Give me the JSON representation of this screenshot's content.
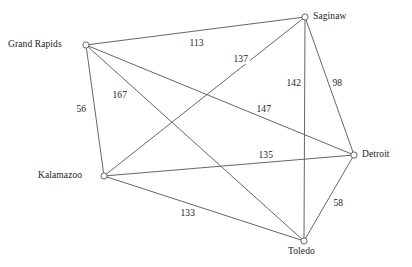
{
  "diagram": {
    "type": "weighted-undirected-graph",
    "background_color": "#ffffff",
    "line_color": "#555555",
    "text_color": "#1a1a1a",
    "width": 412,
    "height": 267,
    "nodes": [
      {
        "id": "grand-rapids",
        "label": "Grand Rapids",
        "x": 86,
        "y": 45,
        "label_x": 8,
        "label_y": 39,
        "label_anchor": "left"
      },
      {
        "id": "saginaw",
        "label": "Saginaw",
        "x": 305,
        "y": 17,
        "label_x": 313,
        "label_y": 11,
        "label_anchor": "left"
      },
      {
        "id": "detroit",
        "label": "Detroit",
        "x": 354,
        "y": 155,
        "label_x": 362,
        "label_y": 149,
        "label_anchor": "left"
      },
      {
        "id": "kalamazoo",
        "label": "Kalamazoo",
        "x": 104,
        "y": 176,
        "label_x": 38,
        "label_y": 170,
        "label_anchor": "left"
      },
      {
        "id": "toledo",
        "label": "Toledo",
        "x": 304,
        "y": 241,
        "label_x": 288,
        "label_y": 246,
        "label_anchor": "left"
      }
    ],
    "edges": [
      {
        "id": "gr-sag",
        "from": "grand-rapids",
        "to": "saginaw",
        "weight": "113",
        "label_x": 188,
        "label_y": 38
      },
      {
        "id": "kal-sag",
        "from": "kalamazoo",
        "to": "saginaw",
        "weight": "137",
        "label_x": 232,
        "label_y": 54
      },
      {
        "id": "sag-tol",
        "from": "saginaw",
        "to": "toledo",
        "weight": "142",
        "label_x": 285,
        "label_y": 78
      },
      {
        "id": "sag-det",
        "from": "saginaw",
        "to": "detroit",
        "weight": "98",
        "label_x": 331,
        "label_y": 78
      },
      {
        "id": "gr-kal",
        "from": "grand-rapids",
        "to": "kalamazoo",
        "weight": "56",
        "label_x": 75,
        "label_y": 104
      },
      {
        "id": "gr-tol",
        "from": "grand-rapids",
        "to": "toledo",
        "weight": "167",
        "label_x": 111,
        "label_y": 90
      },
      {
        "id": "gr-det",
        "from": "grand-rapids",
        "to": "detroit",
        "weight": "147",
        "label_x": 255,
        "label_y": 104
      },
      {
        "id": "kal-det",
        "from": "kalamazoo",
        "to": "detroit",
        "weight": "135",
        "label_x": 257,
        "label_y": 150
      },
      {
        "id": "det-tol",
        "from": "detroit",
        "to": "toledo",
        "weight": "58",
        "label_x": 332,
        "label_y": 198
      },
      {
        "id": "kal-tol",
        "from": "kalamazoo",
        "to": "toledo",
        "weight": "133",
        "label_x": 179,
        "label_y": 208
      }
    ]
  }
}
